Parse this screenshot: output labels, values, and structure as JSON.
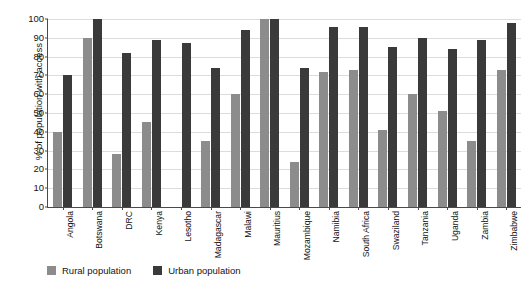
{
  "chart_data": {
    "type": "bar",
    "title": "",
    "xlabel": "",
    "ylabel": "% of population with access",
    "ylim": [
      0,
      100
    ],
    "ytick_step": 10,
    "yticks": [
      100,
      90,
      80,
      70,
      60,
      50,
      40,
      30,
      20,
      10,
      0
    ],
    "grid": true,
    "legend_position": "bottom-left",
    "categories": [
      "Angola",
      "Botswana",
      "DRC",
      "Kenya",
      "Lesotho",
      "Madagascar",
      "Malawi",
      "Mauritius",
      "Mozambique",
      "Namibia",
      "South Africa",
      "Swaziland",
      "Tanzania",
      "Uganda",
      "Zambia",
      "Zimbabwe"
    ],
    "series": [
      {
        "name": "Rural population",
        "color": "#8c8c8c",
        "values": [
          40,
          90,
          28,
          45,
          0,
          35,
          60,
          100,
          24,
          72,
          73,
          41,
          60,
          51,
          35,
          73
        ]
      },
      {
        "name": "Urban population",
        "color": "#3a3a3a",
        "values": [
          70,
          100,
          82,
          89,
          87,
          74,
          94,
          100,
          74,
          96,
          96,
          85,
          90,
          84,
          89,
          98
        ]
      }
    ]
  },
  "legend": {
    "items": [
      {
        "label": "Rural population",
        "color": "#8c8c8c"
      },
      {
        "label": "Urban population",
        "color": "#3a3a3a"
      }
    ]
  },
  "axis": {
    "y_title": "% of population with access"
  },
  "header": {
    "clipped_title": ""
  }
}
